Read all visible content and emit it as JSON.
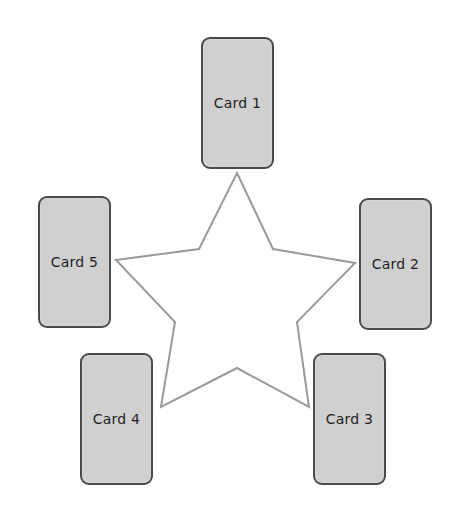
{
  "diagram": {
    "shape": "five-pointed star",
    "star_stroke_color": "#9a9a9a",
    "card_fill_color": "#d0d0d0",
    "card_border_color": "#4a4a4a",
    "cards": [
      {
        "label": "Card 1",
        "position": "top"
      },
      {
        "label": "Card 2",
        "position": "right"
      },
      {
        "label": "Card 3",
        "position": "bottom-right"
      },
      {
        "label": "Card 4",
        "position": "bottom-left"
      },
      {
        "label": "Card 5",
        "position": "left"
      }
    ]
  }
}
